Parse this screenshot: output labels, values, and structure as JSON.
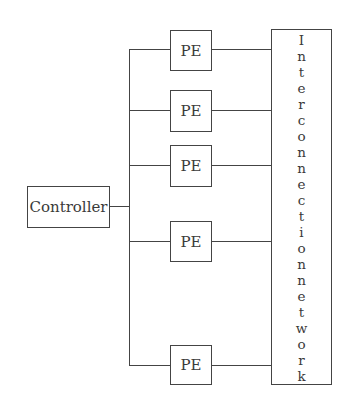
{
  "diagram": {
    "controller": {
      "label": "Controller"
    },
    "processing_elements": [
      {
        "label": "PE"
      },
      {
        "label": "PE"
      },
      {
        "label": "PE"
      },
      {
        "label": "PE"
      },
      {
        "label": "PE"
      }
    ],
    "interconnect": {
      "label": "Interconnection network",
      "letters": [
        "I",
        "n",
        "t",
        "e",
        "r",
        "c",
        "o",
        "n",
        "n",
        "e",
        "c",
        "t",
        "i",
        "o",
        "n",
        "n",
        "e",
        "t",
        "w",
        "o",
        "r",
        "k"
      ]
    }
  }
}
